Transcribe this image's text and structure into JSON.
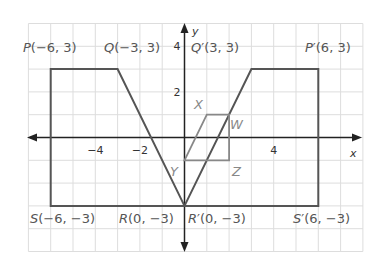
{
  "diagram": {
    "type": "coordinate-plane-transformation",
    "grid": {
      "x_min": -7,
      "x_max": 8,
      "y_min": -5,
      "y_max": 5,
      "step": 1,
      "grid_color": "#dddddd"
    },
    "axes": {
      "x_label": "x",
      "y_label": "y",
      "color": "#222222"
    },
    "ticks": {
      "x": [
        {
          "value": -4,
          "label": "−4"
        },
        {
          "value": -2,
          "label": "−2"
        },
        {
          "value": 4,
          "label": "4"
        }
      ],
      "y": [
        {
          "value": 4,
          "label": "4"
        },
        {
          "value": 2,
          "label": "2"
        }
      ]
    },
    "shapes": [
      {
        "name": "PQRS",
        "color": "#555555",
        "points": [
          [
            -6,
            3
          ],
          [
            -3,
            3
          ],
          [
            0,
            -3
          ],
          [
            -6,
            -3
          ]
        ]
      },
      {
        "name": "P'Q'R'S'",
        "color": "#555555",
        "points": [
          [
            6,
            3
          ],
          [
            3,
            3
          ],
          [
            0,
            -3
          ],
          [
            6,
            -3
          ]
        ]
      },
      {
        "name": "XWZY",
        "color": "#888888",
        "points": [
          [
            1,
            1
          ],
          [
            2,
            1
          ],
          [
            2,
            -1
          ],
          [
            0,
            -1
          ]
        ]
      }
    ],
    "labels": [
      {
        "id": "P",
        "letter": "P",
        "prime": "",
        "coords": "(−6, 3)"
      },
      {
        "id": "Q",
        "letter": "Q",
        "prime": "",
        "coords": "(−3, 3)"
      },
      {
        "id": "Qp",
        "letter": "Q",
        "prime": "′",
        "coords": "(3, 3)"
      },
      {
        "id": "Pp",
        "letter": "P",
        "prime": "′",
        "coords": "(6, 3)"
      },
      {
        "id": "S",
        "letter": "S",
        "prime": "",
        "coords": "(−6, −3)"
      },
      {
        "id": "R",
        "letter": "R",
        "prime": "",
        "coords": "(0, −3)"
      },
      {
        "id": "Rp",
        "letter": "R",
        "prime": "′",
        "coords": "(0, −3)"
      },
      {
        "id": "Sp",
        "letter": "S",
        "prime": "′",
        "coords": "(6, −3)"
      }
    ],
    "vertex_labels": [
      {
        "id": "X",
        "letter": "X"
      },
      {
        "id": "W",
        "letter": "W"
      },
      {
        "id": "Y",
        "letter": "Y"
      },
      {
        "id": "Z",
        "letter": "Z"
      }
    ]
  }
}
